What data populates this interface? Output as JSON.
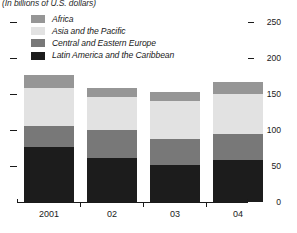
{
  "subtitle": "(In billions of U.S. dollars)",
  "legend": {
    "items": [
      {
        "label": "Africa",
        "color": "#969696"
      },
      {
        "label": "Asia and the Pacific",
        "color": "#e2e2e2"
      },
      {
        "label": "Central and Eastern Europe",
        "color": "#787878"
      },
      {
        "label": "Latin America and the Caribbean",
        "color": "#1c1c1c"
      }
    ]
  },
  "axis": {
    "y_ticks": [
      "250",
      "200",
      "150",
      "100",
      "50",
      "0"
    ],
    "x_labels": [
      "2001",
      "02",
      "03",
      "04"
    ]
  },
  "chart_data": {
    "type": "bar",
    "title": "",
    "subtitle": "(In billions of U.S. dollars)",
    "xlabel": "",
    "ylabel": "",
    "ylim": [
      0,
      250
    ],
    "yticks": [
      0,
      50,
      100,
      150,
      200,
      250
    ],
    "grid": false,
    "stacked": true,
    "legend_position": "top-left",
    "categories": [
      "2001",
      "02",
      "03",
      "04"
    ],
    "series": [
      {
        "name": "Latin America and the Caribbean",
        "color": "#1c1c1c",
        "values": [
          76,
          61,
          51,
          58
        ]
      },
      {
        "name": "Central and Eastern Europe",
        "color": "#787878",
        "values": [
          29,
          39,
          36,
          36
        ]
      },
      {
        "name": "Asia and the Pacific",
        "color": "#e2e2e2",
        "values": [
          53,
          46,
          53,
          56
        ]
      },
      {
        "name": "Africa",
        "color": "#969696",
        "values": [
          18,
          12,
          13,
          17
        ]
      }
    ],
    "totals": [
      176,
      158,
      153,
      167
    ]
  }
}
